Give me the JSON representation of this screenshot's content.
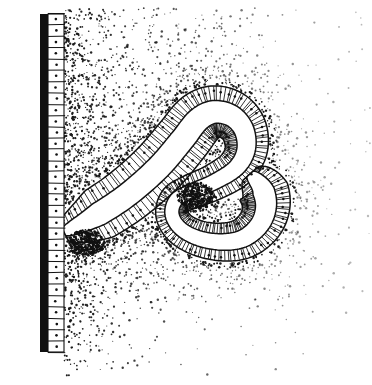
{
  "figure": {
    "panel_label": "B",
    "caption_text": "",
    "background_color": "#ffffff",
    "ink_color": "#111111",
    "width": 372,
    "height": 385
  },
  "structures": {
    "surface_wall": {
      "name": "surface epithelial wall",
      "basement_membrane_band": {
        "x": 40,
        "y_top": 14,
        "y_bottom": 352,
        "thickness": 8,
        "color": "#111111"
      },
      "columnar_cell_layer": {
        "x_inner": 48,
        "x_outer": 64,
        "cell_count": 30,
        "nucleus_dot_radius": 1.3
      }
    },
    "gland": {
      "name": "coiled serpentine gland",
      "lumen_color": "#ffffff",
      "epithelium_color": "#111111",
      "radial_striation_count": 190,
      "nuclei_count": 96,
      "dense_caps": [
        {
          "cx": 196,
          "cy": 196,
          "label": "inner fold tip"
        },
        {
          "cx": 86,
          "cy": 243,
          "label": "basal node at wall"
        }
      ],
      "centerline": [
        [
          64,
          232
        ],
        [
          92,
          218
        ],
        [
          126,
          196
        ],
        [
          158,
          168
        ],
        [
          182,
          140
        ],
        [
          198,
          120
        ],
        [
          214,
          112
        ],
        [
          232,
          116
        ],
        [
          244,
          130
        ],
        [
          246,
          150
        ],
        [
          236,
          168
        ],
        [
          214,
          182
        ],
        [
          190,
          192
        ],
        [
          176,
          200
        ],
        [
          172,
          214
        ],
        [
          180,
          228
        ],
        [
          198,
          238
        ],
        [
          222,
          242
        ],
        [
          244,
          238
        ],
        [
          260,
          224
        ],
        [
          266,
          206
        ],
        [
          262,
          188
        ],
        [
          250,
          174
        ]
      ]
    },
    "stroma": {
      "name": "stippled stromal tissue",
      "dot_color": "#1a1a1a",
      "density_note": "dense along gland basal surface and wall, fading toward right and bottom",
      "approx_dot_count": 2600
    }
  }
}
